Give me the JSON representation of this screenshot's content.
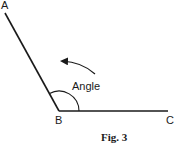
{
  "diagram": {
    "type": "geometry-angle",
    "points": {
      "A": {
        "label": "A"
      },
      "B": {
        "label": "B"
      },
      "C": {
        "label": "C"
      }
    },
    "angle_label": "Angle",
    "caption": "Fig. 3",
    "colors": {
      "line": "#1a1a1a",
      "background": "#ffffff"
    }
  }
}
